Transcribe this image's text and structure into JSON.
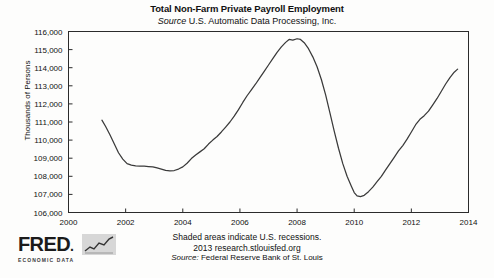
{
  "chart_data": {
    "type": "line",
    "title": "Total Non-Farm Private Payroll Employment",
    "subtitle_prefix": "Source",
    "subtitle_rest": " U.S. Automatic Data Processing, Inc.",
    "xlabel": "",
    "ylabel": "Thousands of Persons",
    "xlim": [
      2000,
      2014
    ],
    "ylim": [
      106000,
      116000
    ],
    "grid": false,
    "legend": "none",
    "xticks": [
      2000,
      2002,
      2004,
      2006,
      2008,
      2010,
      2012,
      2014
    ],
    "xtick_labels": [
      "2000",
      "2002",
      "2004",
      "2006",
      "2008",
      "2010",
      "2012",
      "2014"
    ],
    "yticks": [
      106000,
      107000,
      108000,
      109000,
      110000,
      111000,
      112000,
      113000,
      114000,
      115000,
      116000
    ],
    "ytick_labels": [
      "106,000",
      "107,000",
      "108,000",
      "109,000",
      "110,000",
      "111,000",
      "112,000",
      "113,000",
      "114,000",
      "115,000",
      "116,000"
    ],
    "series": [
      {
        "name": "Total Non-Farm Private Payroll Employment",
        "color": "#3a3a3a",
        "x": [
          2001.17,
          2001.3,
          2001.45,
          2001.6,
          2001.75,
          2001.9,
          2002.05,
          2002.2,
          2002.35,
          2002.5,
          2002.65,
          2002.8,
          2002.95,
          2003.1,
          2003.25,
          2003.4,
          2003.55,
          2003.7,
          2003.85,
          2004.0,
          2004.15,
          2004.3,
          2004.45,
          2004.6,
          2004.75,
          2004.9,
          2005.05,
          2005.2,
          2005.35,
          2005.5,
          2005.65,
          2005.8,
          2005.95,
          2006.1,
          2006.25,
          2006.4,
          2006.55,
          2006.7,
          2006.85,
          2007.0,
          2007.15,
          2007.3,
          2007.45,
          2007.6,
          2007.72,
          2007.85,
          2008.0,
          2008.12,
          2008.25,
          2008.4,
          2008.55,
          2008.7,
          2008.85,
          2009.0,
          2009.15,
          2009.3,
          2009.45,
          2009.6,
          2009.75,
          2009.9,
          2010.0,
          2010.1,
          2010.22,
          2010.35,
          2010.5,
          2010.65,
          2010.8,
          2010.95,
          2011.1,
          2011.25,
          2011.4,
          2011.55,
          2011.7,
          2011.85,
          2012.0,
          2012.15,
          2012.3,
          2012.45,
          2012.6,
          2012.75,
          2012.9,
          2013.05,
          2013.2,
          2013.35,
          2013.5,
          2013.62
        ],
        "y": [
          111100,
          110750,
          110300,
          109800,
          109300,
          108950,
          108700,
          108620,
          108580,
          108560,
          108560,
          108540,
          108520,
          108460,
          108400,
          108330,
          108300,
          108320,
          108400,
          108520,
          108720,
          108980,
          109180,
          109350,
          109520,
          109780,
          110000,
          110200,
          110450,
          110720,
          111000,
          111320,
          111680,
          112080,
          112450,
          112780,
          113100,
          113450,
          113800,
          114150,
          114500,
          114850,
          115150,
          115400,
          115560,
          115520,
          115600,
          115560,
          115380,
          115050,
          114600,
          114050,
          113350,
          112500,
          111500,
          110500,
          109550,
          108700,
          108000,
          107450,
          107100,
          106920,
          106880,
          106950,
          107150,
          107400,
          107700,
          108000,
          108350,
          108700,
          109050,
          109400,
          109700,
          110050,
          110450,
          110850,
          111150,
          111350,
          111600,
          111950,
          112300,
          112700,
          113100,
          113450,
          113750,
          113920
        ]
      }
    ],
    "footer_lines": [
      "Shaded areas indicate U.S. recessions.",
      "2013 research.stlouisfed.org"
    ],
    "footer_source_prefix": "Source:",
    "footer_source_rest": " Federal Reserve Bank of St. Louis",
    "logo": {
      "wordmark": "FRED",
      "tagline": "ECONOMIC DATA"
    }
  }
}
